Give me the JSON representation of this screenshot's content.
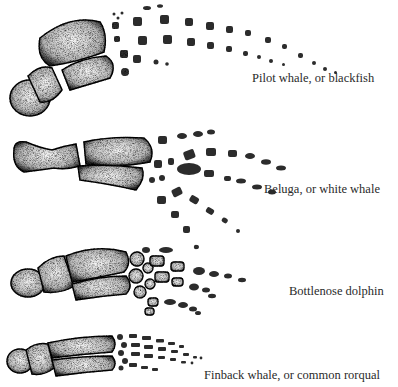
{
  "figure": {
    "panels": [
      {
        "id": "pilot-whale",
        "label": "Pilot whale, or blackfish"
      },
      {
        "id": "beluga",
        "label": "Beluga, or white whale"
      },
      {
        "id": "bottlenose-dolphin",
        "label": "Bottlenose dolphin"
      },
      {
        "id": "finback-whale",
        "label": "Finback whale, or common rorqual"
      }
    ],
    "colors": {
      "background": "#ffffff",
      "ink": "#1a1a1a",
      "bone_fill": "#e9e9e9",
      "text": "#2a2a2a"
    }
  }
}
